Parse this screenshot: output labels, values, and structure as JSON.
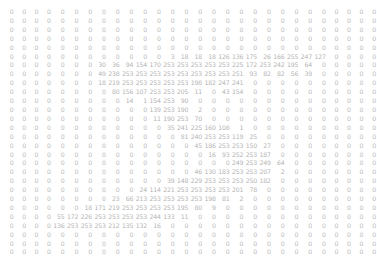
{
  "view": {
    "title": "pixel-value-matrix",
    "description": "28x28 grayscale pixel intensity matrix printed as numbers",
    "background_color": "#ffffff",
    "text_color": "#b9b9b9",
    "rows": 28,
    "columns": 28,
    "value_range": [
      0,
      255
    ]
  },
  "chart_data": {
    "type": "heatmap",
    "title": "",
    "xlabel": "",
    "ylabel": "",
    "grid": false,
    "legend": "none",
    "rows": 28,
    "columns": 28,
    "vmin": 0,
    "vmax": 255,
    "matrix": [
      [
        0,
        0,
        0,
        0,
        0,
        0,
        0,
        0,
        0,
        0,
        0,
        0,
        0,
        0,
        0,
        0,
        0,
        0,
        0,
        0,
        0,
        0,
        0,
        0,
        0,
        0,
        0,
        0
      ],
      [
        0,
        0,
        0,
        0,
        0,
        0,
        0,
        0,
        0,
        0,
        0,
        0,
        0,
        0,
        0,
        0,
        0,
        0,
        0,
        0,
        0,
        0,
        0,
        0,
        0,
        0,
        0,
        0
      ],
      [
        0,
        0,
        0,
        0,
        0,
        0,
        0,
        0,
        0,
        0,
        0,
        0,
        0,
        0,
        0,
        0,
        0,
        0,
        0,
        0,
        0,
        0,
        0,
        0,
        0,
        0,
        0,
        0
      ],
      [
        0,
        0,
        0,
        0,
        0,
        0,
        0,
        0,
        0,
        0,
        0,
        0,
        0,
        0,
        0,
        0,
        0,
        0,
        0,
        0,
        0,
        0,
        0,
        0,
        0,
        0,
        0,
        0
      ],
      [
        0,
        0,
        0,
        0,
        0,
        0,
        0,
        0,
        0,
        0,
        0,
        0,
        0,
        0,
        0,
        0,
        0,
        0,
        0,
        0,
        0,
        0,
        0,
        0,
        0,
        0,
        0,
        0
      ],
      [
        0,
        0,
        0,
        0,
        0,
        0,
        0,
        0,
        0,
        0,
        0,
        0,
        3,
        18,
        18,
        18,
        126,
        136,
        175,
        26,
        166,
        255,
        247,
        127,
        0,
        0,
        0,
        0
      ],
      [
        0,
        0,
        0,
        0,
        0,
        0,
        0,
        30,
        36,
        94,
        154,
        170,
        253,
        253,
        253,
        253,
        253,
        225,
        172,
        253,
        242,
        195,
        64,
        0,
        0,
        0,
        0,
        0
      ],
      [
        0,
        0,
        0,
        0,
        0,
        0,
        0,
        49,
        238,
        253,
        253,
        253,
        253,
        253,
        253,
        253,
        253,
        251,
        93,
        82,
        82,
        56,
        39,
        0,
        0,
        0,
        0,
        0
      ],
      [
        0,
        0,
        0,
        0,
        0,
        0,
        0,
        18,
        219,
        253,
        253,
        253,
        253,
        253,
        198,
        182,
        247,
        241,
        0,
        0,
        0,
        0,
        0,
        0,
        0,
        0,
        0,
        0
      ],
      [
        0,
        0,
        0,
        0,
        0,
        0,
        0,
        0,
        80,
        156,
        107,
        253,
        253,
        205,
        11,
        0,
        43,
        154,
        0,
        0,
        0,
        0,
        0,
        0,
        0,
        0,
        0,
        0
      ],
      [
        0,
        0,
        0,
        0,
        0,
        0,
        0,
        0,
        0,
        14,
        1,
        154,
        253,
        90,
        0,
        0,
        0,
        0,
        0,
        0,
        0,
        0,
        0,
        0,
        0,
        0,
        0,
        0
      ],
      [
        0,
        0,
        0,
        0,
        0,
        0,
        0,
        0,
        0,
        0,
        0,
        139,
        253,
        190,
        2,
        0,
        0,
        0,
        0,
        0,
        0,
        0,
        0,
        0,
        0,
        0,
        0,
        0
      ],
      [
        0,
        0,
        0,
        0,
        0,
        0,
        0,
        0,
        0,
        0,
        0,
        11,
        190,
        253,
        70,
        0,
        0,
        0,
        0,
        0,
        0,
        0,
        0,
        0,
        0,
        0,
        0,
        0
      ],
      [
        0,
        0,
        0,
        0,
        0,
        0,
        0,
        0,
        0,
        0,
        0,
        0,
        35,
        241,
        225,
        160,
        108,
        1,
        0,
        0,
        0,
        0,
        0,
        0,
        0,
        0,
        0,
        0
      ],
      [
        0,
        0,
        0,
        0,
        0,
        0,
        0,
        0,
        0,
        0,
        0,
        0,
        0,
        81,
        240,
        253,
        253,
        119,
        25,
        0,
        0,
        0,
        0,
        0,
        0,
        0,
        0,
        0
      ],
      [
        0,
        0,
        0,
        0,
        0,
        0,
        0,
        0,
        0,
        0,
        0,
        0,
        0,
        0,
        45,
        186,
        253,
        253,
        150,
        27,
        0,
        0,
        0,
        0,
        0,
        0,
        0,
        0
      ],
      [
        0,
        0,
        0,
        0,
        0,
        0,
        0,
        0,
        0,
        0,
        0,
        0,
        0,
        0,
        0,
        16,
        93,
        252,
        253,
        187,
        0,
        0,
        0,
        0,
        0,
        0,
        0,
        0
      ],
      [
        0,
        0,
        0,
        0,
        0,
        0,
        0,
        0,
        0,
        0,
        0,
        0,
        0,
        0,
        0,
        0,
        0,
        249,
        253,
        249,
        64,
        0,
        0,
        0,
        0,
        0,
        0,
        0
      ],
      [
        0,
        0,
        0,
        0,
        0,
        0,
        0,
        0,
        0,
        0,
        0,
        0,
        0,
        0,
        46,
        130,
        183,
        253,
        253,
        207,
        2,
        0,
        0,
        0,
        0,
        0,
        0,
        0
      ],
      [
        0,
        0,
        0,
        0,
        0,
        0,
        0,
        0,
        0,
        0,
        0,
        0,
        39,
        148,
        229,
        253,
        253,
        253,
        250,
        182,
        0,
        0,
        0,
        0,
        0,
        0,
        0,
        0
      ],
      [
        0,
        0,
        0,
        0,
        0,
        0,
        0,
        0,
        0,
        0,
        24,
        114,
        221,
        253,
        253,
        253,
        253,
        201,
        78,
        0,
        0,
        0,
        0,
        0,
        0,
        0,
        0,
        0
      ],
      [
        0,
        0,
        0,
        0,
        0,
        0,
        0,
        0,
        23,
        66,
        213,
        253,
        253,
        253,
        253,
        198,
        81,
        2,
        0,
        0,
        0,
        0,
        0,
        0,
        0,
        0,
        0,
        0
      ],
      [
        0,
        0,
        0,
        0,
        0,
        0,
        18,
        171,
        219,
        253,
        253,
        253,
        253,
        195,
        80,
        9,
        0,
        0,
        0,
        0,
        0,
        0,
        0,
        0,
        0,
        0,
        0,
        0
      ],
      [
        0,
        0,
        0,
        0,
        55,
        172,
        226,
        253,
        253,
        253,
        253,
        244,
        133,
        11,
        0,
        0,
        0,
        0,
        0,
        0,
        0,
        0,
        0,
        0,
        0,
        0,
        0,
        0
      ],
      [
        0,
        0,
        0,
        0,
        136,
        253,
        253,
        253,
        212,
        135,
        132,
        16,
        0,
        0,
        0,
        0,
        0,
        0,
        0,
        0,
        0,
        0,
        0,
        0,
        0,
        0,
        0,
        0
      ],
      [
        0,
        0,
        0,
        0,
        0,
        0,
        0,
        0,
        0,
        0,
        0,
        0,
        0,
        0,
        0,
        0,
        0,
        0,
        0,
        0,
        0,
        0,
        0,
        0,
        0,
        0,
        0,
        0
      ],
      [
        0,
        0,
        0,
        0,
        0,
        0,
        0,
        0,
        0,
        0,
        0,
        0,
        0,
        0,
        0,
        0,
        0,
        0,
        0,
        0,
        0,
        0,
        0,
        0,
        0,
        0,
        0,
        0
      ],
      [
        0,
        0,
        0,
        0,
        0,
        0,
        0,
        0,
        0,
        0,
        0,
        0,
        0,
        0,
        0,
        0,
        0,
        0,
        0,
        0,
        0,
        0,
        0,
        0,
        0,
        0,
        0,
        0
      ]
    ]
  }
}
